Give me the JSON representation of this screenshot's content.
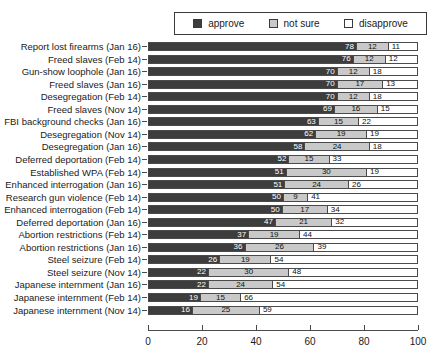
{
  "chart_data": {
    "type": "bar",
    "subtype": "stacked-horizontal-100",
    "title": "",
    "xlabel": "",
    "ylabel": "",
    "xlim": [
      0,
      100
    ],
    "xticks": [
      0,
      20,
      40,
      60,
      80,
      100
    ],
    "grid": false,
    "legend_position": "top",
    "legend": [
      "approve",
      "not sure",
      "disapprove"
    ],
    "series": [
      {
        "name": "approve",
        "color": "#3d3d3d",
        "values": [
          78,
          76,
          70,
          70,
          70,
          69,
          63,
          62,
          58,
          52,
          51,
          51,
          50,
          50,
          47,
          37,
          36,
          26,
          22,
          22,
          19,
          16
        ]
      },
      {
        "name": "not sure",
        "color": "#c9c9c9",
        "values": [
          12,
          12,
          12,
          17,
          12,
          16,
          15,
          19,
          24,
          15,
          30,
          24,
          9,
          17,
          21,
          19,
          26,
          19,
          30,
          24,
          15,
          25
        ]
      },
      {
        "name": "disapprove",
        "color": "#ffffff",
        "values": [
          11,
          12,
          18,
          13,
          18,
          15,
          22,
          19,
          18,
          33,
          19,
          26,
          41,
          34,
          32,
          44,
          39,
          54,
          48,
          54,
          66,
          59
        ]
      }
    ],
    "categories": [
      "Report lost firearms (Jan 16)",
      "Freed slaves (Feb 14)",
      "Gun-show loophole (Jan 16)",
      "Freed slaves (Jan 16)",
      "Desegregation (Feb 14)",
      "Freed slaves (Nov 14)",
      "FBI background checks (Jan 16)",
      "Desegregation (Nov 14)",
      "Desegregation (Jan 16)",
      "Deferred deportation (Feb 14)",
      "Established WPA (Feb 14)",
      "Enhanced interrogation (Jan 16)",
      "Research gun violence (Feb 14)",
      "Enhanced interrogation (Feb 14)",
      "Deferred deportation (Jan 16)",
      "Abortion restrictions (Feb 14)",
      "Abortion restrictions (Jan 16)",
      "Steel seizure (Feb 14)",
      "Steel seizure (Nov 14)",
      "Japanese internment (Jan 16)",
      "Japanese internment (Feb 14)",
      "Japanese internment (Nov 14)"
    ]
  }
}
